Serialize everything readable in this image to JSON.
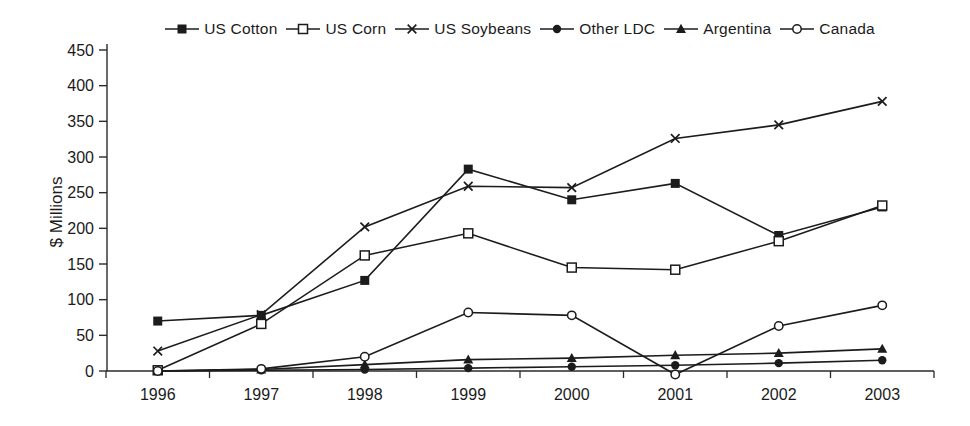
{
  "figure": {
    "background": "#ffffff",
    "line_color": "#1c1c1c",
    "axis_color": "#2a2a2a"
  },
  "chart_data": {
    "type": "line",
    "title": "",
    "xlabel": "",
    "ylabel": "$ Millions",
    "categories": [
      "1996",
      "1997",
      "1998",
      "1999",
      "2000",
      "2001",
      "2002",
      "2003"
    ],
    "ylim": [
      0,
      450
    ],
    "ytick_step": 50,
    "grid": false,
    "legend_position": "top",
    "series": [
      {
        "name": "US Cotton",
        "marker": "square-filled",
        "values": [
          70,
          78,
          127,
          283,
          240,
          263,
          190,
          230
        ]
      },
      {
        "name": "US Corn",
        "marker": "square-open",
        "values": [
          1,
          66,
          162,
          193,
          145,
          142,
          182,
          232
        ]
      },
      {
        "name": "US Soybeans",
        "marker": "x",
        "values": [
          28,
          79,
          202,
          259,
          257,
          326,
          345,
          378
        ]
      },
      {
        "name": "Other LDC",
        "marker": "circle-filled",
        "values": [
          0,
          1,
          2,
          4,
          6,
          8,
          11,
          15
        ]
      },
      {
        "name": "Argentina",
        "marker": "triangle-filled",
        "values": [
          0,
          2,
          9,
          16,
          18,
          22,
          25,
          31
        ]
      },
      {
        "name": "Canada",
        "marker": "circle-open",
        "values": [
          0,
          3,
          20,
          82,
          78,
          -5,
          63,
          92
        ]
      }
    ]
  }
}
